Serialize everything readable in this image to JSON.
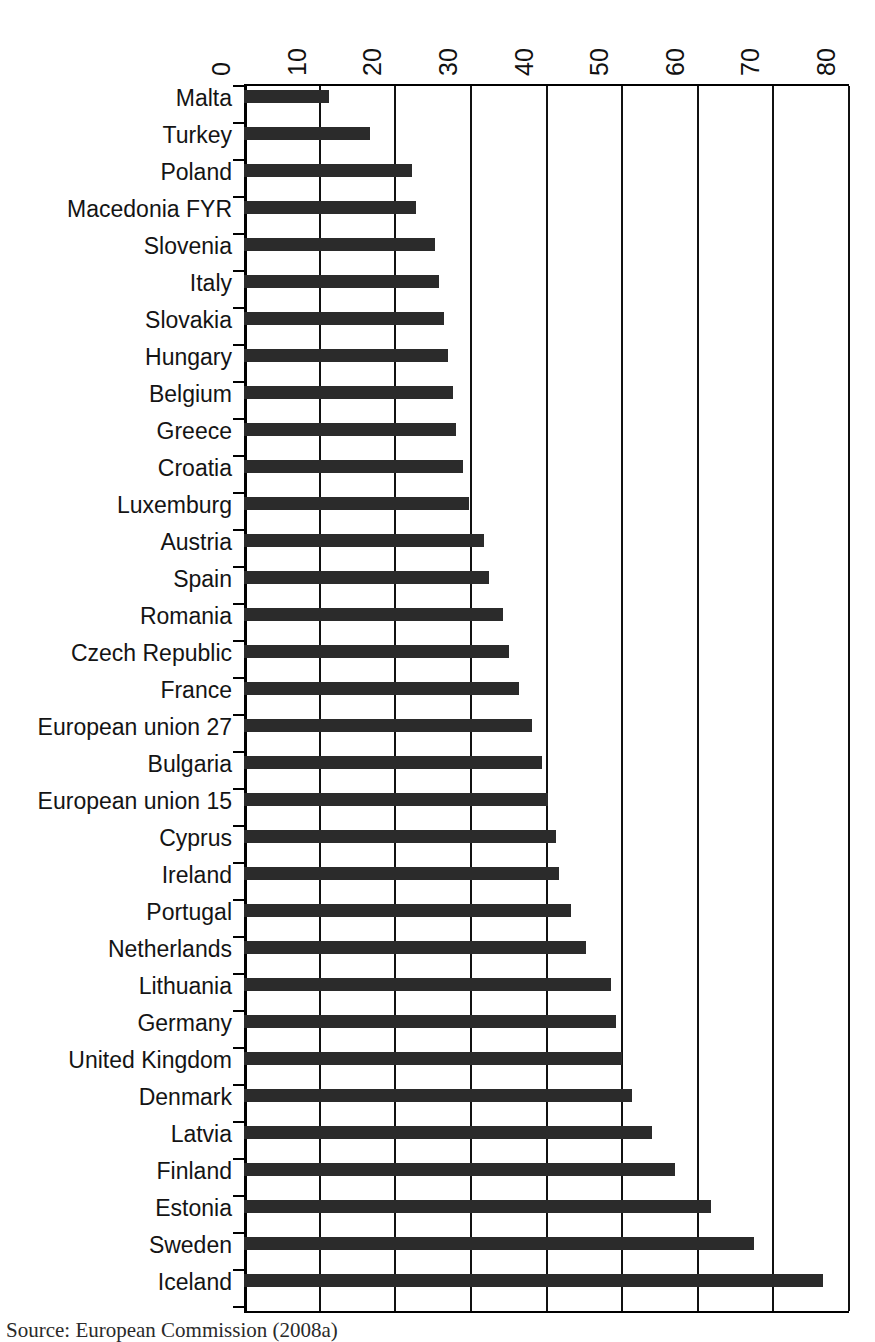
{
  "chart_data": {
    "type": "bar",
    "orientation": "horizontal",
    "title": "",
    "xlabel": "",
    "ylabel": "",
    "xlim": [
      0,
      80
    ],
    "xticks": [
      0,
      10,
      20,
      30,
      40,
      50,
      60,
      70,
      80
    ],
    "xtick_labels": [
      "0",
      "10",
      "20",
      "30",
      "40",
      "50",
      "60",
      "70",
      "80"
    ],
    "grid": true,
    "grid_axis": "x",
    "legend": false,
    "bar_color": "#2b2b2b",
    "axis_color": "#000000",
    "tick_label_rotation": 90,
    "categories": [
      "Malta",
      "Turkey",
      "Poland",
      "Macedonia FYR",
      "Slovenia",
      "Italy",
      "Slovakia",
      "Hungary",
      "Belgium",
      "Greece",
      "Croatia",
      "Luxemburg",
      "Austria",
      "Spain",
      "Romania",
      "Czech Republic",
      "France",
      "European union 27",
      "Bulgaria",
      "European union 15",
      "Cyprus",
      "Ireland",
      "Portugal",
      "Netherlands",
      "Lithuania",
      "Germany",
      "United Kingdom",
      "Denmark",
      "Latvia",
      "Finland",
      "Estonia",
      "Sweden",
      "Iceland"
    ],
    "values": [
      11.2,
      16.6,
      22.2,
      22.7,
      25.2,
      25.8,
      26.5,
      27.0,
      27.6,
      28.0,
      28.9,
      29.8,
      31.7,
      32.4,
      34.2,
      35.1,
      36.4,
      38.1,
      39.4,
      40.2,
      41.2,
      41.6,
      43.2,
      45.2,
      48.5,
      49.2,
      50.0,
      51.3,
      54.0,
      57.0,
      61.8,
      67.5,
      76.5
    ]
  },
  "source": {
    "caption": "Source: European Commission (2008a)"
  }
}
